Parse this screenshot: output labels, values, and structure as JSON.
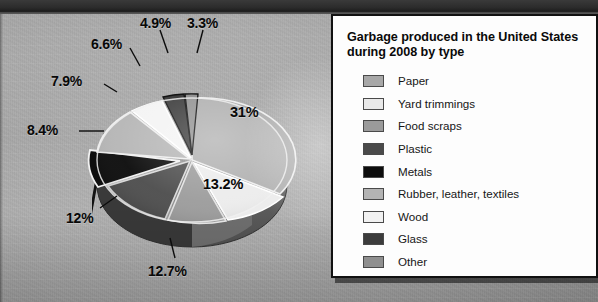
{
  "legend": {
    "title": "Garbage produced in the United States during 2008 by type",
    "items": [
      {
        "label": "Paper",
        "color": "#a8a8a8"
      },
      {
        "label": "Yard trimmings",
        "color": "#e9e9e9"
      },
      {
        "label": "Food scraps",
        "color": "#9b9b9b"
      },
      {
        "label": "Plastic",
        "color": "#4a4a4a"
      },
      {
        "label": "Metals",
        "color": "#0d0d0d"
      },
      {
        "label": "Rubber, leather, textiles",
        "color": "#b4b4b4"
      },
      {
        "label": "Wood",
        "color": "#f1f1f1"
      },
      {
        "label": "Glass",
        "color": "#3c3c3c"
      },
      {
        "label": "Other",
        "color": "#8f8f8f"
      }
    ]
  },
  "chart_data": {
    "type": "pie",
    "title": "Garbage produced in the United States during 2008 by type",
    "legend_position": "right",
    "grid": false,
    "categories": [
      "Paper",
      "Yard trimmings",
      "Food scraps",
      "Plastic",
      "Metals",
      "Rubber, leather, textiles",
      "Wood",
      "Glass",
      "Other"
    ],
    "values": [
      31,
      13.2,
      12.7,
      12,
      8.4,
      7.9,
      6.6,
      4.9,
      3.3
    ],
    "unit": "%",
    "labels": [
      "31%",
      "13.2%",
      "12.7%",
      "12%",
      "8.4%",
      "7.9%",
      "6.6%",
      "4.9%",
      "3.3%"
    ],
    "colors": [
      "#a8a8a8",
      "#e9e9e9",
      "#9b9b9b",
      "#4a4a4a",
      "#0d0d0d",
      "#b4b4b4",
      "#f1f1f1",
      "#3c3c3c",
      "#8f8f8f"
    ]
  },
  "pie_labels": {
    "paper": "31%",
    "yard": "13.2%",
    "food": "12.7%",
    "plastic": "12%",
    "metals": "8.4%",
    "rubber": "7.9%",
    "wood": "6.6%",
    "glass": "4.9%",
    "other": "3.3%"
  }
}
